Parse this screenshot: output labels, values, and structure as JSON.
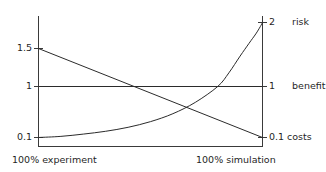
{
  "chart_data": {
    "type": "line",
    "title": "",
    "subtitle": "",
    "xlabel": "",
    "ylabel": "",
    "grid": false,
    "legend_position": "right-axis-labels",
    "x_axis": {
      "left_label": "100% experiment",
      "right_label": "100% simulation",
      "range": [
        0,
        100
      ],
      "tick_labels": [
        "100% experiment",
        "100% simulation"
      ]
    },
    "y_axis_left": {
      "tick_labels": [
        "1.5",
        "1",
        "0.1"
      ],
      "tick_values": [
        1.5,
        1,
        0.1
      ]
    },
    "y_axis_right": {
      "tick_labels": [
        "2",
        "1",
        "0.1"
      ],
      "tick_values": [
        2,
        1,
        0.1
      ],
      "series_names": [
        "risk",
        "benefit",
        "costs"
      ]
    },
    "series": [
      {
        "name": "risk",
        "shape": "exponential-rising",
        "start_value": 0.1,
        "end_value": 2,
        "right_tick_label": "2",
        "right_series_label": "risk",
        "x": [
          0,
          10,
          20,
          30,
          40,
          50,
          60,
          70,
          80,
          85,
          90,
          94,
          97,
          99,
          100
        ],
        "values": [
          0.1,
          0.12,
          0.16,
          0.21,
          0.28,
          0.38,
          0.52,
          0.72,
          1.0,
          1.18,
          1.4,
          1.6,
          1.78,
          1.92,
          2.0
        ]
      },
      {
        "name": "benefit",
        "shape": "constant",
        "start_value": 1,
        "end_value": 1,
        "right_tick_label": "1",
        "right_series_label": "benefit",
        "x": [
          0,
          100
        ],
        "values": [
          1,
          1
        ]
      },
      {
        "name": "costs",
        "shape": "linear-falling",
        "start_value": 1.5,
        "end_value": 0.1,
        "right_tick_label": "0.1",
        "right_series_label": "costs",
        "x": [
          0,
          100
        ],
        "values": [
          1.5,
          0.1
        ]
      }
    ],
    "colors": {
      "axis": "#3a3a3a",
      "series": "#2b2b2b",
      "text": "#1f1f1f",
      "background": "#ffffff"
    }
  },
  "labels": {
    "left_tick_1_5": "1.5",
    "left_tick_1": "1",
    "left_tick_0_1": "0.1",
    "right_tick_2": "2",
    "right_tick_1": "1",
    "right_tick_0_1": "0.1",
    "right_name_risk": "risk",
    "right_name_benefit": "benefit",
    "right_name_costs": "costs",
    "x_left": "100% experiment",
    "x_right": "100% simulation"
  }
}
